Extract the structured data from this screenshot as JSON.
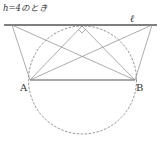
{
  "caption": "h=4のとき",
  "labels": {
    "line": "ℓ",
    "point_a": "A",
    "point_b": "B"
  },
  "geometry": {
    "line_l": {
      "x1": 4,
      "y1": 25,
      "x2": 157,
      "y2": 25
    },
    "point_a": {
      "x": 30,
      "y": 80
    },
    "point_b": {
      "x": 135,
      "y": 80
    },
    "left_point": {
      "x": 12,
      "y": 25
    },
    "right_point": {
      "x": 152,
      "y": 25
    },
    "top_point": {
      "x": 82,
      "y": 26
    },
    "circle": {
      "cx": 82.5,
      "cy": 80,
      "r": 54
    },
    "right_angle_mark": true
  },
  "colors": {
    "line": "#555555",
    "thin": "#888888",
    "dashed": "#777777",
    "text": "#333333"
  }
}
